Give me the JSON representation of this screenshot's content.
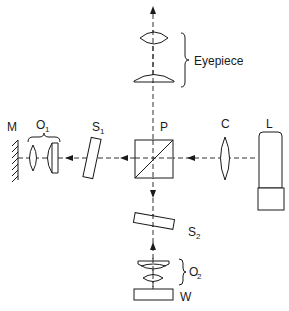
{
  "diagram": {
    "type": "optical-schematic",
    "labels": {
      "mirror": "M",
      "objective1": "O",
      "objective1_sub": "1",
      "slide1": "S",
      "slide1_sub": "1",
      "prism": "P",
      "condenser": "C",
      "lamp": "L",
      "eyepiece": "Eyepiece",
      "slide2": "S",
      "slide2_sub": "2",
      "objective2": "O",
      "objective2_sub": "2",
      "workpiece": "W"
    },
    "colors": {
      "ink": "#1a1a1a",
      "background": "#ffffff"
    }
  }
}
